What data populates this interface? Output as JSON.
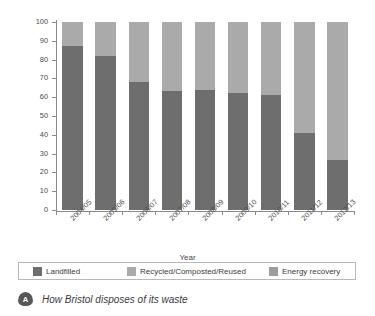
{
  "chart_data": {
    "type": "bar",
    "subtype": "stacked-100-percent",
    "title": "How Bristol disposes of its waste",
    "xlabel": "Year",
    "ylabel": "% of total waste",
    "ylim": [
      0,
      100
    ],
    "ytick_step": 10,
    "grid": false,
    "legend_position": "bottom",
    "categories": [
      "2004/05",
      "2005/06",
      "2006/07",
      "2007/08",
      "2008/09",
      "2009/10",
      "2010/11",
      "2011/12",
      "2012/13"
    ],
    "yticks": [
      "0",
      "10",
      "20",
      "30",
      "40",
      "50",
      "60",
      "70",
      "80",
      "90",
      "100"
    ],
    "series": [
      {
        "name": "Landfilled",
        "color": "#6e6e6e",
        "values": [
          87,
          82,
          68,
          63.5,
          64,
          62,
          61,
          41,
          26.5
        ]
      },
      {
        "name": "Recycled/Composted/Reused",
        "color": "#aaaaaa",
        "values": [
          13,
          18,
          32,
          36.5,
          36,
          38,
          39,
          59,
          73.5
        ]
      },
      {
        "name": "Energy recovery",
        "color": "#9d9d9d",
        "values": [
          0,
          0,
          0,
          0,
          0,
          0,
          0,
          0,
          0
        ]
      }
    ]
  },
  "legend": {
    "items": [
      {
        "label": "Landfilled",
        "color": "#6e6e6e"
      },
      {
        "label": "Recycled/Composted/Reused",
        "color": "#aaaaaa"
      },
      {
        "label": "Energy recovery",
        "color": "#9d9d9d"
      }
    ]
  },
  "caption": {
    "badge": "A",
    "text": "How Bristol disposes of its waste"
  }
}
